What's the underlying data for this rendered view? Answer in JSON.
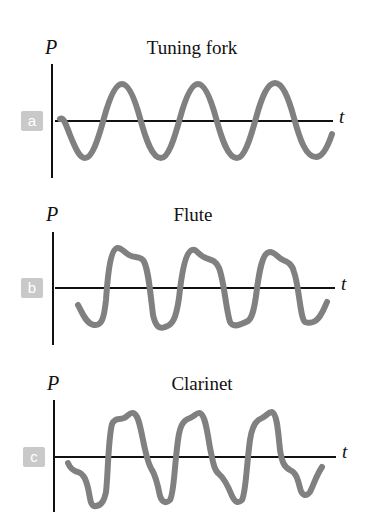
{
  "figure": {
    "panels": [
      {
        "label": "a",
        "title": "Tuning fork",
        "y_axis": "P",
        "x_axis": "t"
      },
      {
        "label": "b",
        "title": "Flute",
        "y_axis": "P",
        "x_axis": "t"
      },
      {
        "label": "c",
        "title": "Clarinet",
        "y_axis": "P",
        "x_axis": "t"
      }
    ],
    "colors": {
      "wave": "#808080",
      "axis": "#111111",
      "badge": "#c9c9c9"
    }
  }
}
